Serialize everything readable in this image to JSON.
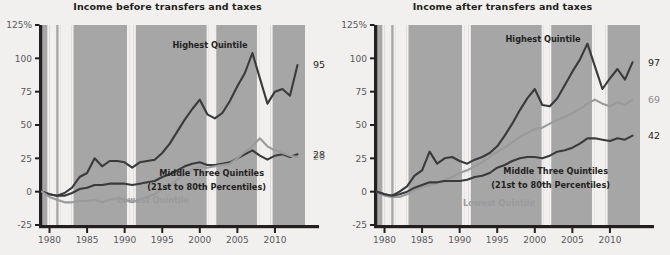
{
  "figure": {
    "panels": [
      {
        "id": "before",
        "title": "Income before transfers and taxes",
        "annotations": [
          {
            "name": "highest-quintile",
            "text": "Highest Quintile",
            "x": 210,
            "y": 48,
            "color": "dark",
            "anchor": "middle"
          },
          {
            "name": "middle-three-quintiles-line1",
            "text": "Middle Three Quintiles",
            "x": 264,
            "y": 176,
            "color": "dark",
            "anchor": "end"
          },
          {
            "name": "middle-three-quintiles-line2",
            "text": "(21st to 80th Percentiles)",
            "x": 266,
            "y": 190,
            "color": "dark",
            "anchor": "end"
          },
          {
            "name": "lowest-quintile",
            "text": "Lowest Quintile",
            "x": 117,
            "y": 203,
            "color": "gray",
            "anchor": "start"
          }
        ],
        "end_labels": [
          {
            "name": "end-label-highest",
            "text": "95",
            "value": 95,
            "color": "dark"
          },
          {
            "name": "end-label-middle",
            "text": "28",
            "value": 28,
            "color": "dark"
          },
          {
            "name": "end-label-lowest",
            "text": "26",
            "value": 26,
            "color": "gray"
          }
        ]
      },
      {
        "id": "after",
        "title": "Income after transfers and taxes",
        "annotations": [
          {
            "name": "highest-quintile",
            "text": "Highest Quintile",
            "x": 208,
            "y": 42,
            "color": "dark",
            "anchor": "middle"
          },
          {
            "name": "middle-three-quintiles-line1",
            "text": "Middle Three Quintiles",
            "x": 273,
            "y": 174,
            "color": "dark",
            "anchor": "end"
          },
          {
            "name": "middle-three-quintiles-line2",
            "text": "(21st to 80th Percentiles)",
            "x": 275,
            "y": 188,
            "color": "dark",
            "anchor": "end"
          },
          {
            "name": "lowest-quintile",
            "text": "Lowest Quintile",
            "x": 128,
            "y": 206,
            "color": "gray",
            "anchor": "start"
          }
        ],
        "end_labels": [
          {
            "name": "end-label-highest",
            "text": "97",
            "value": 97,
            "color": "dark"
          },
          {
            "name": "end-label-lowest",
            "text": "69",
            "value": 69,
            "color": "gray"
          },
          {
            "name": "end-label-middle",
            "text": "42",
            "value": 42,
            "color": "dark"
          }
        ]
      }
    ]
  },
  "axes": {
    "y_ticks": [
      "125%",
      "100",
      "75",
      "50",
      "25",
      "0",
      "-25"
    ],
    "y_values": [
      125,
      100,
      75,
      50,
      25,
      0,
      -25
    ],
    "ylim": [
      -25,
      125
    ],
    "x_ticks": [
      "1980",
      "1985",
      "1990",
      "1995",
      "2000",
      "2005",
      "2010"
    ],
    "x_values": [
      1980,
      1985,
      1990,
      1995,
      2000,
      2005,
      2010
    ],
    "xlim": [
      1979,
      2014
    ]
  },
  "colors": {
    "background": "#f2f0ee",
    "band": "#a6a6a6",
    "axis": "#231f20",
    "dark_line": "#3a3a3c",
    "gray_line": "#9a9a9c",
    "tick_text": "#58585b",
    "title_text": "#231f20"
  },
  "recession_bands": [
    {
      "start": 1980.0,
      "end": 1980.6
    },
    {
      "start": 1981.5,
      "end": 1982.9
    },
    {
      "start": 1990.6,
      "end": 1991.2
    },
    {
      "start": 2001.2,
      "end": 2001.9
    },
    {
      "start": 2007.9,
      "end": 2009.4
    }
  ],
  "chart_data": {
    "type": "line",
    "xlabel": "",
    "ylabel": "Percent",
    "xlim": [
      1979,
      2014
    ],
    "ylim": [
      -25,
      125
    ],
    "grid": false,
    "legend": "inline-annotations",
    "x": [
      1979,
      1980,
      1981,
      1982,
      1983,
      1984,
      1985,
      1986,
      1987,
      1988,
      1989,
      1990,
      1991,
      1992,
      1993,
      1994,
      1995,
      1996,
      1997,
      1998,
      1999,
      2000,
      2001,
      2002,
      2003,
      2004,
      2005,
      2006,
      2007,
      2008,
      2009,
      2010,
      2011,
      2012,
      2013
    ],
    "panels": [
      {
        "name": "Income before transfers and taxes",
        "series": [
          {
            "name": "Highest Quintile",
            "color": "#3a3a3c",
            "end_label": 95,
            "values": [
              0,
              -2,
              -3,
              -1,
              3,
              11,
              14,
              25,
              19,
              23,
              23,
              22,
              18,
              22,
              23,
              24,
              29,
              36,
              45,
              54,
              62,
              69,
              58,
              55,
              59,
              68,
              79,
              89,
              104,
              85,
              66,
              75,
              77,
              72,
              95
            ]
          },
          {
            "name": "Middle Three Quintiles",
            "color": "#3a3a3c",
            "end_label": 28,
            "values": [
              0,
              -2,
              -3,
              -3,
              -1,
              2,
              3,
              5,
              5,
              6,
              6,
              6,
              5,
              6,
              7,
              8,
              11,
              13,
              16,
              19,
              21,
              22,
              20,
              20,
              21,
              22,
              25,
              28,
              31,
              27,
              24,
              27,
              28,
              26,
              28
            ]
          },
          {
            "name": "Lowest Quintile",
            "color": "#9a9a9c",
            "end_label": 26,
            "values": [
              0,
              -4,
              -6,
              -8,
              -8,
              -7,
              -7,
              -6,
              -8,
              -6,
              -5,
              -6,
              -8,
              -6,
              -4,
              -2,
              2,
              4,
              9,
              13,
              17,
              19,
              18,
              19,
              20,
              21,
              25,
              30,
              34,
              40,
              34,
              31,
              29,
              27,
              26
            ]
          }
        ]
      },
      {
        "name": "Income after transfers and taxes",
        "series": [
          {
            "name": "Highest Quintile",
            "color": "#3a3a3c",
            "end_label": 97,
            "values": [
              0,
              -2,
              -3,
              0,
              4,
              12,
              16,
              30,
              21,
              25,
              26,
              23,
              21,
              24,
              26,
              29,
              34,
              42,
              51,
              61,
              70,
              77,
              65,
              64,
              70,
              80,
              90,
              99,
              111,
              94,
              77,
              85,
              92,
              84,
              97
            ]
          },
          {
            "name": "Lowest Quintile",
            "color": "#9a9a9c",
            "end_label": 69,
            "values": [
              0,
              -3,
              -4,
              -4,
              -2,
              1,
              3,
              5,
              6,
              9,
              11,
              14,
              16,
              19,
              22,
              26,
              30,
              33,
              37,
              41,
              44,
              47,
              48,
              51,
              54,
              56,
              59,
              62,
              66,
              69,
              66,
              64,
              67,
              65,
              69
            ]
          },
          {
            "name": "Middle Three Quintiles",
            "color": "#3a3a3c",
            "end_label": 42,
            "values": [
              0,
              -2,
              -3,
              -2,
              0,
              3,
              5,
              7,
              7,
              8,
              8,
              8,
              9,
              11,
              12,
              14,
              18,
              20,
              23,
              25,
              26,
              26,
              25,
              27,
              30,
              31,
              33,
              36,
              40,
              40,
              39,
              38,
              40,
              39,
              42
            ]
          }
        ]
      }
    ]
  }
}
